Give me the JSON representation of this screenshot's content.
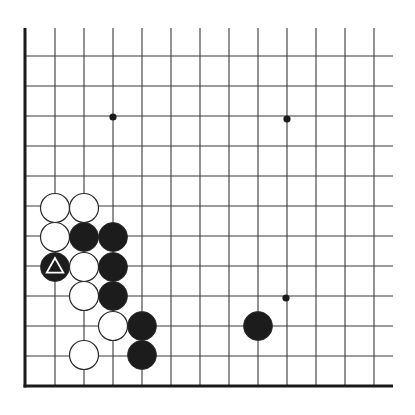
{
  "diagram": {
    "type": "go-board-fragment",
    "view": "lower-left corner",
    "grid": {
      "columns_x": [
        25,
        55,
        84,
        113,
        142,
        171,
        200,
        229,
        258,
        287,
        316,
        345,
        374
      ],
      "rows_y": [
        56,
        86,
        116,
        146,
        176,
        206,
        236,
        266,
        296,
        326,
        356,
        386
      ],
      "top_y": 28,
      "right_x": 393,
      "edge_left_x": 25,
      "edge_bottom_y": 386,
      "line_color": "#3a3a3a",
      "edge_color": "#1a1a1a"
    },
    "star_points": [
      {
        "x": 113,
        "y": 117
      },
      {
        "x": 287,
        "y": 119
      },
      {
        "x": 286,
        "y": 298
      }
    ],
    "stones": [
      {
        "color": "white",
        "x": 55,
        "y": 208
      },
      {
        "color": "white",
        "x": 84,
        "y": 208
      },
      {
        "color": "white",
        "x": 55,
        "y": 237
      },
      {
        "color": "black",
        "x": 84,
        "y": 237
      },
      {
        "color": "black",
        "x": 113,
        "y": 237
      },
      {
        "color": "black",
        "x": 55,
        "y": 267,
        "marker": "triangle"
      },
      {
        "color": "white",
        "x": 84,
        "y": 267
      },
      {
        "color": "black",
        "x": 113,
        "y": 267
      },
      {
        "color": "white",
        "x": 84,
        "y": 296
      },
      {
        "color": "black",
        "x": 113,
        "y": 296
      },
      {
        "color": "white",
        "x": 113,
        "y": 326
      },
      {
        "color": "black",
        "x": 142,
        "y": 326
      },
      {
        "color": "white",
        "x": 84,
        "y": 355
      },
      {
        "color": "black",
        "x": 142,
        "y": 355
      },
      {
        "color": "black",
        "x": 258,
        "y": 326
      }
    ],
    "stone_radius": 14.5,
    "colors": {
      "black_stone": "#1c1c1c",
      "white_stone": "#ffffff",
      "stone_outline": "#2a2a2a",
      "triangle_marker": "#ffffff"
    }
  }
}
